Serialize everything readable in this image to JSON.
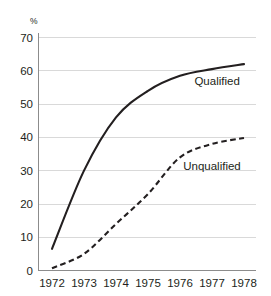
{
  "chart_data": {
    "type": "line",
    "title": "",
    "subtitle": "",
    "xlabel": "",
    "ylabel": "%",
    "x": [
      1972,
      1973,
      1974,
      1975,
      1976,
      1977,
      1978
    ],
    "xticklabels": [
      "1972",
      "1973",
      "1974",
      "1975",
      "1976",
      "1977",
      "1978"
    ],
    "yticks": [
      0,
      10,
      20,
      30,
      40,
      50,
      60,
      70
    ],
    "yticklabels": [
      "0",
      "10",
      "20",
      "30",
      "40",
      "50",
      "60",
      "70"
    ],
    "ylim": [
      0,
      70
    ],
    "xlim": [
      1972,
      1978
    ],
    "grid": "horizontal",
    "legend_position": "inline-annotation",
    "series": [
      {
        "name": "Qualified",
        "style": "solid",
        "color": "#231f20",
        "values": [
          6.5,
          30,
          46,
          54,
          58.5,
          60.5,
          62
        ]
      },
      {
        "name": "Unqualified",
        "style": "dashed",
        "color": "#231f20",
        "values": [
          0.7,
          5,
          14,
          23,
          34,
          38,
          39.8
        ]
      }
    ],
    "annotations": [
      {
        "text": "Qualified",
        "x": 1976.45,
        "y": 57.0
      },
      {
        "text": "Unqualified",
        "x": 1976.1,
        "y": 31.5
      }
    ]
  },
  "axis": {
    "unit_label": "%"
  }
}
